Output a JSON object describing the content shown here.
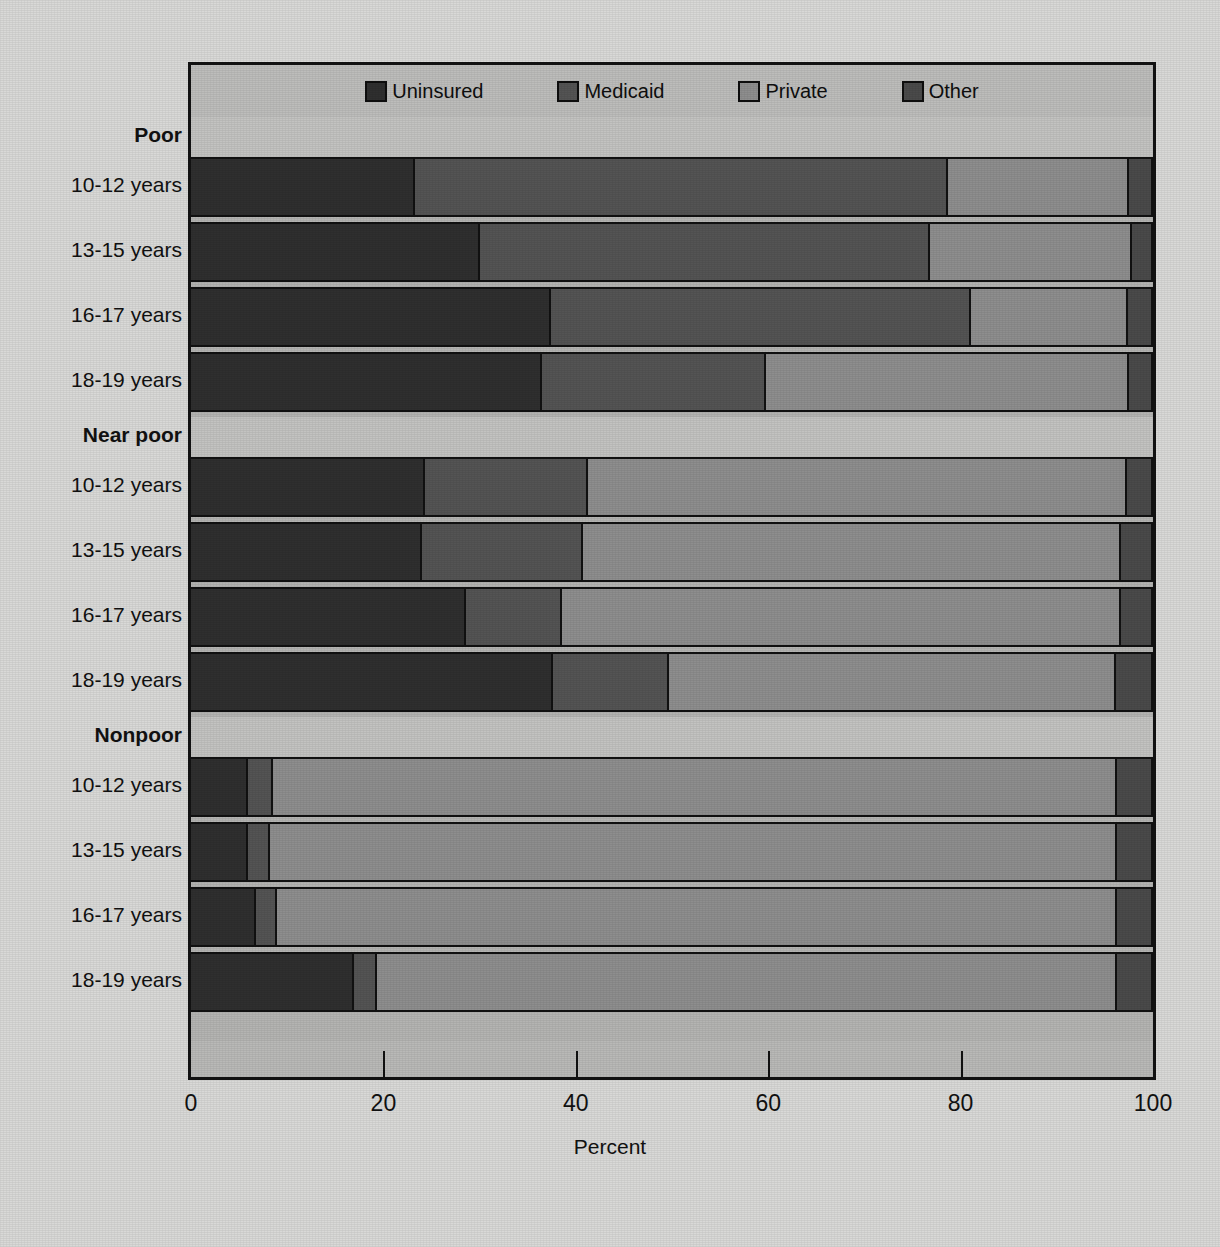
{
  "chart_data": {
    "type": "bar",
    "orientation": "horizontal",
    "stacked": true,
    "title": "",
    "xlabel": "Percent",
    "ylabel": "",
    "xlim": [
      0,
      100
    ],
    "xticks": [
      0,
      20,
      40,
      60,
      80,
      100
    ],
    "xticklabels": [
      "0",
      "20",
      "40",
      "60",
      "80",
      "100"
    ],
    "grid": false,
    "legend_position": "top-center",
    "legend": [
      "Uninsured",
      "Medicaid",
      "Private",
      "Other"
    ],
    "series": [
      {
        "name": "Uninsured",
        "color": "#2f2f2f",
        "values": [
          23.3,
          30.1,
          37.5,
          36.6,
          24.4,
          24.1,
          28.6,
          37.7,
          5.9,
          5.9,
          6.8,
          17.0
        ]
      },
      {
        "name": "Medicaid",
        "color": "#545454",
        "values": [
          55.6,
          46.9,
          43.8,
          23.3,
          17.0,
          16.7,
          10.0,
          12.1,
          2.6,
          2.3,
          2.2,
          2.4
        ]
      },
      {
        "name": "Private",
        "color": "#8e8e8e",
        "values": [
          18.8,
          21.0,
          16.3,
          37.8,
          56.1,
          56.1,
          58.3,
          46.6,
          88.0,
          88.3,
          87.5,
          77.1
        ]
      },
      {
        "name": "Other",
        "color": "#4a4a4a",
        "values": [
          2.3,
          2.0,
          2.4,
          2.3,
          2.5,
          3.1,
          3.1,
          3.6,
          3.5,
          3.5,
          3.5,
          3.5
        ]
      }
    ],
    "groups": [
      {
        "label": "Poor",
        "categories": [
          "10-12 years",
          "13-15 years",
          "16-17 years",
          "18-19 years"
        ],
        "rows": [
          {
            "category": "10-12 years",
            "Uninsured": 23.3,
            "Medicaid": 55.6,
            "Private": 18.8,
            "Other": 2.3
          },
          {
            "category": "13-15 years",
            "Uninsured": 30.1,
            "Medicaid": 46.9,
            "Private": 21.0,
            "Other": 2.0
          },
          {
            "category": "16-17 years",
            "Uninsured": 37.5,
            "Medicaid": 43.8,
            "Private": 16.3,
            "Other": 2.4
          },
          {
            "category": "18-19 years",
            "Uninsured": 36.6,
            "Medicaid": 23.3,
            "Private": 37.8,
            "Other": 2.3
          }
        ]
      },
      {
        "label": "Near poor",
        "categories": [
          "10-12 years",
          "13-15 years",
          "16-17 years",
          "18-19 years"
        ],
        "rows": [
          {
            "category": "10-12 years",
            "Uninsured": 24.4,
            "Medicaid": 17.0,
            "Private": 56.1,
            "Other": 2.5
          },
          {
            "category": "13-15 years",
            "Uninsured": 24.1,
            "Medicaid": 16.7,
            "Private": 56.1,
            "Other": 3.1
          },
          {
            "category": "16-17 years",
            "Uninsured": 28.6,
            "Medicaid": 10.0,
            "Private": 58.3,
            "Other": 3.1
          },
          {
            "category": "18-19 years",
            "Uninsured": 37.7,
            "Medicaid": 12.1,
            "Private": 46.6,
            "Other": 3.6
          }
        ]
      },
      {
        "label": "Nonpoor",
        "categories": [
          "10-12 years",
          "13-15 years",
          "16-17 years",
          "18-19 years"
        ],
        "rows": [
          {
            "category": "10-12 years",
            "Uninsured": 5.9,
            "Medicaid": 2.6,
            "Private": 88.0,
            "Other": 3.5
          },
          {
            "category": "13-15 years",
            "Uninsured": 5.9,
            "Medicaid": 2.3,
            "Private": 88.3,
            "Other": 3.5
          },
          {
            "category": "16-17 years",
            "Uninsured": 6.8,
            "Medicaid": 2.2,
            "Private": 87.5,
            "Other": 3.5
          },
          {
            "category": "18-19 years",
            "Uninsured": 17.0,
            "Medicaid": 2.4,
            "Private": 77.1,
            "Other": 3.5
          }
        ]
      }
    ]
  },
  "legend": {
    "items": [
      {
        "label": "Uninsured",
        "color": "#2f2f2f"
      },
      {
        "label": "Medicaid",
        "color": "#545454"
      },
      {
        "label": "Private",
        "color": "#8e8e8e"
      },
      {
        "label": "Other",
        "color": "#4a4a4a"
      }
    ]
  },
  "axis": {
    "x_title": "Percent",
    "x_ticks": [
      "0",
      "20",
      "40",
      "60",
      "80",
      "100"
    ]
  },
  "colors": {
    "uninsured": "#2f2f2f",
    "medicaid": "#545454",
    "private": "#8e8e8e",
    "other": "#4a4a4a",
    "background": "#d9d9d7",
    "panel": "#b4b4b2",
    "band": "#c3c3c1",
    "outline": "#121212"
  }
}
